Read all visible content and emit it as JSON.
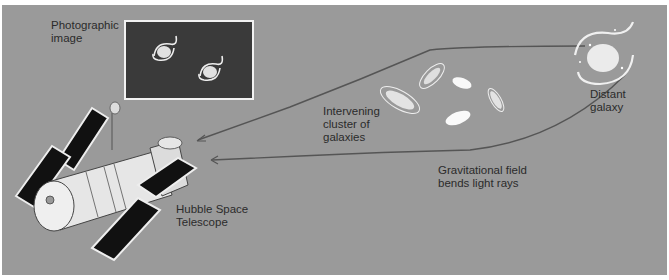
{
  "figure": {
    "labels": {
      "photographic_image": [
        "Photographic",
        "image"
      ],
      "intervening_cluster": [
        "Intervening",
        "cluster of",
        "galaxies"
      ],
      "distant_galaxy": [
        "Distant",
        "galaxy"
      ],
      "gravitational_field": [
        "Gravitational field",
        "bends light rays"
      ],
      "hubble": [
        "Hubble Space",
        "Telescope"
      ]
    },
    "colors": {
      "background": "#9a9a9a",
      "ray": "#555555",
      "photo_bg": "#3a3a3a",
      "solar_panel": "#111111",
      "telescope_body": "#e6e6e6"
    }
  }
}
